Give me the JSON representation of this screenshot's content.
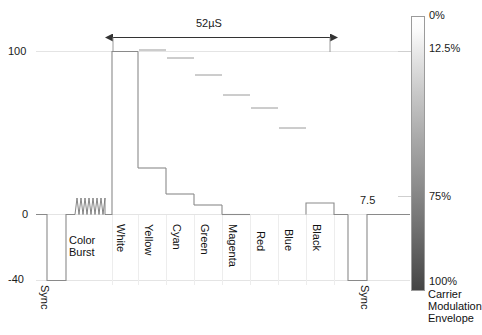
{
  "figure": {
    "axis": {
      "y_ticks": [
        {
          "label": "100",
          "value": 100
        },
        {
          "label": "0",
          "value": 0
        },
        {
          "label": "-40",
          "value": -40
        }
      ],
      "units": "IRE"
    },
    "dimension": {
      "label": "52µS",
      "value": 52,
      "unit": "µS"
    },
    "levels": {
      "black_setup_label": "7.5",
      "black_setup_value": 7.5
    },
    "segments": [
      {
        "name": "Sync",
        "label": "Sync",
        "level": -40,
        "type": "pulse"
      },
      {
        "name": "ColorBurst",
        "label": "Color\nBurst",
        "label_line1": "Color",
        "label_line2": "Burst",
        "level": 0,
        "type": "burst"
      },
      {
        "name": "White",
        "label": "White",
        "level": 100,
        "type": "flat"
      },
      {
        "name": "Yellow",
        "label": "Yellow",
        "level": 89,
        "type": "modulated"
      },
      {
        "name": "Cyan",
        "label": "Cyan",
        "level": 72,
        "type": "modulated"
      },
      {
        "name": "Green",
        "label": "Green",
        "level": 61,
        "type": "modulated"
      },
      {
        "name": "Magenta",
        "label": "Magenta",
        "level": 46,
        "type": "modulated"
      },
      {
        "name": "Red",
        "label": "Red",
        "level": 34,
        "type": "modulated"
      },
      {
        "name": "Blue",
        "label": "Blue",
        "level": 18,
        "type": "modulated"
      },
      {
        "name": "Black",
        "label": "Black",
        "level": 7.5,
        "type": "flat"
      },
      {
        "name": "Sync2",
        "label": "Sync",
        "level": -40,
        "type": "pulse"
      }
    ],
    "gradient_scale": {
      "title_line1": "Carrier",
      "title_line2": "Modulation",
      "title_line3": "Envelope",
      "ticks": [
        {
          "label": "0%",
          "value": 0
        },
        {
          "label": "12.5%",
          "value": 12.5
        },
        {
          "label": "75%",
          "value": 75
        },
        {
          "label": "100%",
          "value": 100
        }
      ],
      "color_top": "#ffffff",
      "color_bottom": "#4a4a4a"
    },
    "colors": {
      "trace": "#7a7a7a",
      "text": "#111111",
      "grid": "#e8e8e8",
      "arrow": "#444444"
    }
  }
}
